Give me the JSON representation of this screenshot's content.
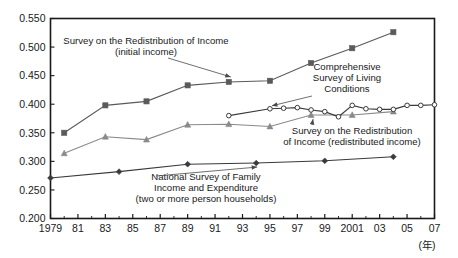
{
  "chart_data": {
    "type": "line",
    "title": "",
    "xlabel": "(年)",
    "ylabel": "",
    "xlim": [
      1979,
      2007
    ],
    "ylim": [
      0.2,
      0.55
    ],
    "grid": false,
    "legend_position": "inline-annotations",
    "y_ticks": [
      "0.550",
      "0.500",
      "0.450",
      "0.400",
      "0.350",
      "0.300",
      "0.250",
      "0.200"
    ],
    "y_tick_values": [
      0.55,
      0.5,
      0.45,
      0.4,
      0.35,
      0.3,
      0.25,
      0.2
    ],
    "x_ticks": [
      "1979",
      "81",
      "83",
      "85",
      "87",
      "89",
      "91",
      "93",
      "95",
      "97",
      "99",
      "2001",
      "03",
      "05",
      "07"
    ],
    "x_tick_values": [
      1979,
      1981,
      1983,
      1985,
      1987,
      1989,
      1991,
      1993,
      1995,
      1997,
      1999,
      2001,
      2003,
      2005,
      2007
    ],
    "series": [
      {
        "name": "Survey on the Redistribution of Income (initial income)",
        "marker": "filled-square",
        "color": "#5a5a5a",
        "x": [
          1980,
          1983,
          1986,
          1989,
          1992,
          1995,
          1998,
          2001,
          2004
        ],
        "values": [
          0.35,
          0.398,
          0.405,
          0.433,
          0.439,
          0.441,
          0.472,
          0.498,
          0.526
        ]
      },
      {
        "name": "Survey on the Redistribution of Income (redistributed income)",
        "marker": "filled-triangle",
        "color": "#8a8a8a",
        "x": [
          1980,
          1983,
          1986,
          1989,
          1992,
          1995,
          1998,
          2001,
          2004
        ],
        "values": [
          0.314,
          0.343,
          0.338,
          0.364,
          0.365,
          0.361,
          0.381,
          0.381,
          0.387
        ]
      },
      {
        "name": "Comprehensive Survey of Living Conditions",
        "marker": "open-circle",
        "color": "#3a3a3a",
        "x": [
          1992,
          1995,
          1996,
          1997,
          1998,
          1999,
          2000,
          2001,
          2002,
          2003,
          2004,
          2005,
          2006,
          2007
        ],
        "values": [
          0.38,
          0.392,
          0.393,
          0.394,
          0.39,
          0.387,
          0.378,
          0.398,
          0.392,
          0.391,
          0.391,
          0.398,
          0.398,
          0.399
        ]
      },
      {
        "name": "National Survey of Family Income and Expenditure (two or more person households)",
        "marker": "filled-diamond",
        "color": "#3a3a3a",
        "x": [
          1979,
          1984,
          1989,
          1994,
          1999,
          2004
        ],
        "values": [
          0.271,
          0.282,
          0.295,
          0.297,
          0.301,
          0.308
        ]
      }
    ],
    "annotations": [
      {
        "id": "initial-income",
        "lines": [
          "Survey on the Redistribution of Income",
          "(initial income)"
        ],
        "points_to": {
          "year": 1992,
          "value": 0.439
        }
      },
      {
        "id": "living-conditions",
        "lines": [
          "Comprehensive",
          "Survey of Living",
          "Conditions"
        ],
        "points_to": {
          "year": 1995,
          "value": 0.392
        }
      },
      {
        "id": "redistributed-income",
        "lines": [
          "Survey on the Redistribution",
          "of Income (redistributed income)"
        ],
        "points_to": {
          "year": 1998,
          "value": 0.381
        }
      },
      {
        "id": "family-income-expenditure",
        "lines": [
          "National Survey of Family",
          "Income and Expenditure",
          "(two or more person households)"
        ],
        "points_to": {
          "year": 1994,
          "value": 0.297
        }
      }
    ]
  }
}
